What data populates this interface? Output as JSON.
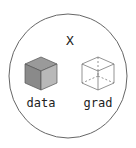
{
  "diagram": {
    "variable_name": "X",
    "components": [
      {
        "label": "data",
        "style": "filled-cube"
      },
      {
        "label": "grad",
        "style": "wireframe-cube"
      }
    ],
    "colors": {
      "outline": "#666666",
      "cube_fill_top": "#9a9a9a",
      "cube_fill_front": "#8a8a8a",
      "cube_fill_side": "#b5b5b5",
      "text": "#222222"
    }
  }
}
